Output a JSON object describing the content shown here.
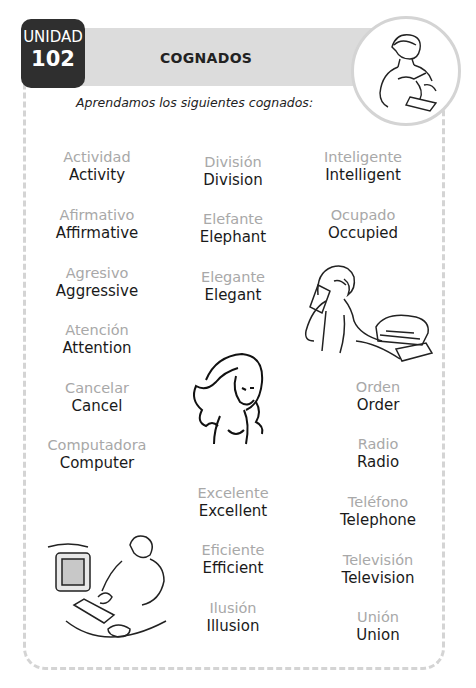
{
  "header": {
    "unit_label": "UNIDAD",
    "unit_number": "102",
    "title": "COGNADOS",
    "subtitle": "Aprendamos los siguientes cognados:"
  },
  "columns": [
    {
      "words": [
        {
          "es": "Actividad",
          "en": "Activity"
        },
        {
          "es": "Afirmativo",
          "en": "Affirmative"
        },
        {
          "es": "Agresivo",
          "en": "Aggressive"
        },
        {
          "es": "Atención",
          "en": "Attention"
        },
        {
          "es": "Cancelar",
          "en": "Cancel"
        },
        {
          "es": "Computadora",
          "en": "Computer"
        }
      ]
    },
    {
      "words": [
        {
          "es": "División",
          "en": "Division"
        },
        {
          "es": "Elefante",
          "en": "Elephant"
        },
        {
          "es": "Elegante",
          "en": "Elegant"
        },
        {
          "es": "Excelente",
          "en": "Excellent"
        },
        {
          "es": "Eficiente",
          "en": "Efficient"
        },
        {
          "es": "Ilusión",
          "en": "Illusion"
        }
      ]
    },
    {
      "words": [
        {
          "es": "Inteligente",
          "en": "Intelligent"
        },
        {
          "es": "Ocupado",
          "en": "Occupied"
        },
        {
          "es": "Orden",
          "en": "Order"
        },
        {
          "es": "Radio",
          "en": "Radio"
        },
        {
          "es": "Teléfono",
          "en": "Telephone"
        },
        {
          "es": "Televisión",
          "en": "Television"
        },
        {
          "es": "Unión",
          "en": "Union"
        }
      ]
    }
  ],
  "illustrations": [
    "man-writing",
    "woman-printer",
    "woman-portrait",
    "man-computer"
  ],
  "colors": {
    "unit_badge": "#2f2f2f",
    "band": "#dcdcdc",
    "spanish_text": "#a8a8a8",
    "english_text": "#1a1a1a",
    "border": "#d4d4d4"
  }
}
